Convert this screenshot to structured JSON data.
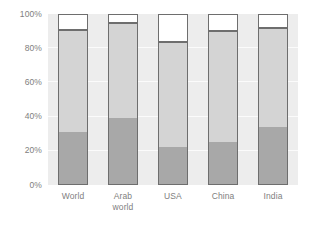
{
  "chart_data": {
    "type": "bar",
    "subtype": "stacked-100-percent",
    "title": "",
    "subtitle": "",
    "xlabel": "",
    "ylabel": "",
    "ylim": [
      0,
      100
    ],
    "yunit": "%",
    "grid": true,
    "legend": "none",
    "categories": [
      "World",
      "Arab world",
      "USA",
      "China",
      "India"
    ],
    "category_labels_multiline": [
      [
        "World"
      ],
      [
        "Arab",
        "world"
      ],
      [
        "USA"
      ],
      [
        "China"
      ],
      [
        "India"
      ]
    ],
    "y_ticks": [
      0,
      20,
      40,
      60,
      80,
      100
    ],
    "y_tick_labels": [
      "0%",
      "20%",
      "40%",
      "60%",
      "80%",
      "100%"
    ],
    "series": [
      {
        "name": "bottom-segment",
        "color": "#a8a8a8",
        "values": [
          31,
          39,
          22,
          25,
          34
        ]
      },
      {
        "name": "middle-segment",
        "color": "#d4d4d4",
        "values": [
          60,
          56,
          62,
          65.5,
          58.5
        ]
      },
      {
        "name": "top-segment",
        "color": "#ffffff",
        "values": [
          9,
          5,
          16,
          9.5,
          7.5
        ]
      }
    ],
    "colors": {
      "plot_background": "#ededed",
      "gridline": "#fbfbfb",
      "bar_outline": "#6e6e6e",
      "tick_text": "#808080",
      "page_background": "#ffffff"
    }
  }
}
